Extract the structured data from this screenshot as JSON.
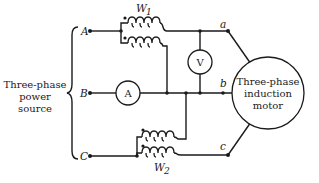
{
  "diagram": {
    "source": {
      "label_line1": "Three-phase",
      "label_line2": "power",
      "label_line3": "source",
      "terminals": [
        "A",
        "B",
        "C"
      ]
    },
    "load": {
      "label_line1": "Three-phase",
      "label_line2": "induction",
      "label_line3": "motor",
      "terminals": [
        "a",
        "b",
        "c"
      ]
    },
    "meters": {
      "wattmeter1": {
        "label": "W",
        "subscript": "1"
      },
      "wattmeter2": {
        "label": "W",
        "subscript": "2"
      },
      "ammeter": {
        "label": "A"
      },
      "voltmeter": {
        "label": "V"
      }
    },
    "colors": {
      "line": "#1a1a1a",
      "background": "#ffffff"
    }
  }
}
